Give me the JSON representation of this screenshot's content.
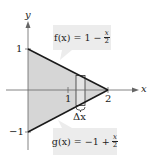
{
  "diagram": {
    "axes": {
      "x_label": "x",
      "y_label": "y",
      "x_ticks": [
        "1",
        "2"
      ],
      "y_ticks": [
        "1",
        "−1"
      ]
    },
    "functions": {
      "f": {
        "lhs": "f(x) = 1 −",
        "num": "x",
        "den": "2"
      },
      "g": {
        "lhs": "g(x) = −1 +",
        "num": "x",
        "den": "2"
      }
    },
    "rectangle_label": "Δx",
    "colors": {
      "fill": "#d6d6d6",
      "line": "#1a1a1a",
      "axis": "#555555",
      "label_box": "#ececec"
    }
  }
}
